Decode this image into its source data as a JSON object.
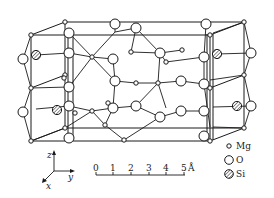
{
  "figure": {
    "legend": [
      {
        "symbol": "small-open-circle",
        "label": "Mg"
      },
      {
        "symbol": "large-open-circle",
        "label": "O"
      },
      {
        "symbol": "hatched-circle",
        "label": "Si"
      }
    ],
    "axes": {
      "z": "z",
      "y": "y",
      "x": "x"
    },
    "scale_bar": {
      "ticks": [
        "0",
        "1",
        "2",
        "3",
        "4",
        "5"
      ],
      "unit": "Å"
    }
  }
}
